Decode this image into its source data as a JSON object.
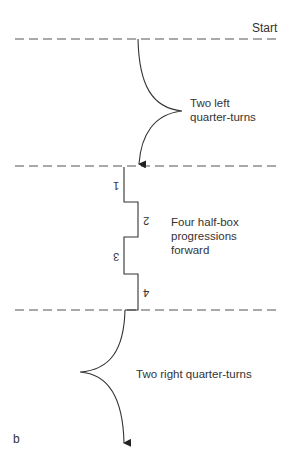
{
  "figure": {
    "panel_label": "b",
    "start_label": "Start",
    "sections": [
      {
        "name": "left-turns",
        "label_lines": [
          "Two left",
          "quarter-turns"
        ]
      },
      {
        "name": "half-box-progressions",
        "label_lines": [
          "Four half-box",
          "progressions",
          "forward"
        ],
        "step_numbers": [
          "1",
          "2",
          "3",
          "4"
        ]
      },
      {
        "name": "right-turns",
        "label_lines": [
          "Two right quarter-turns"
        ]
      }
    ],
    "colors": {
      "line": "#333333",
      "dash": "#555555",
      "text": "#333333",
      "background": "#ffffff"
    }
  }
}
